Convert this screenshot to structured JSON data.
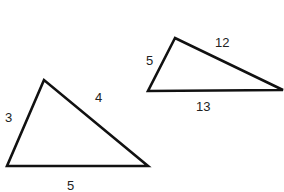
{
  "diagram": {
    "triangles": [
      {
        "name": "triangle-3-4-5",
        "vertices": [
          [
            44,
            80
          ],
          [
            7,
            166
          ],
          [
            148,
            166
          ]
        ],
        "sides": {
          "left": "3",
          "right": "4",
          "bottom": "5"
        },
        "label_positions": {
          "left": [
            5,
            122
          ],
          "right": [
            95,
            102
          ],
          "bottom": [
            67,
            190
          ]
        }
      },
      {
        "name": "triangle-5-12-13",
        "vertices": [
          [
            175,
            38
          ],
          [
            148,
            91
          ],
          [
            283,
            90
          ]
        ],
        "sides": {
          "left": "5",
          "top": "12",
          "bottom": "13"
        },
        "label_positions": {
          "left": [
            146,
            65
          ],
          "top": [
            215,
            47
          ],
          "bottom": [
            196,
            111
          ]
        }
      }
    ]
  }
}
